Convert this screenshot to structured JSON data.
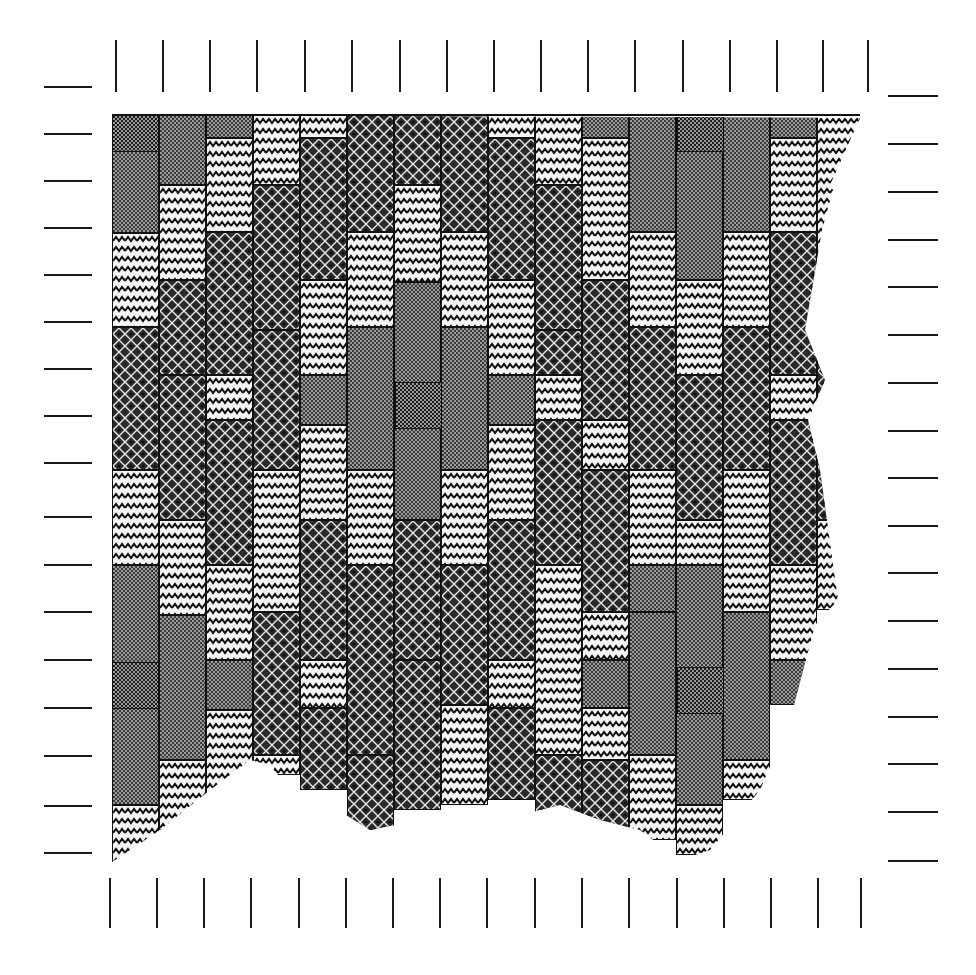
{
  "figure": {
    "kind": "woven tile / textile pattern diagram",
    "pattern_types": {
      "Z": "light zigzag (chevron) block",
      "D": "dark diamond-and-dot block",
      "C": "dark checker block (forms cross motifs)"
    },
    "colors": {
      "ink": "#111111",
      "paper": "#ffffff",
      "zigzag_bg": "#f4f4f4",
      "diamond_bg": "#2a2a2a",
      "checker_bg": "#3b3b3b"
    }
  },
  "frame": {
    "top_border": {
      "x1": 112,
      "x2": 860,
      "y": 115
    },
    "columns_x": [
      112,
      159,
      206,
      253,
      300,
      347,
      394,
      441,
      488,
      535,
      582,
      629,
      676,
      723,
      770,
      817,
      860
    ]
  },
  "ticks": {
    "top": {
      "y1": 40,
      "y2": 92,
      "x": [
        116,
        163,
        210,
        257,
        305,
        352,
        400,
        447,
        494,
        541,
        588,
        635,
        683,
        730,
        777,
        823,
        868
      ]
    },
    "bottom": {
      "y1": 878,
      "y2": 928,
      "x": [
        110,
        157,
        204,
        251,
        299,
        346,
        393,
        440,
        487,
        535,
        582,
        629,
        677,
        724,
        771,
        818,
        861
      ]
    },
    "left": {
      "x1": 44,
      "x2": 92,
      "y": [
        87,
        134,
        181,
        228,
        275,
        322,
        369,
        416,
        463,
        517,
        565,
        612,
        660,
        708,
        756,
        806,
        853
      ]
    },
    "right": {
      "x1": 888,
      "x2": 938,
      "y": [
        96,
        144,
        192,
        240,
        287,
        335,
        383,
        431,
        478,
        526,
        573,
        621,
        669,
        717,
        764,
        812,
        861
      ]
    }
  },
  "columns": [
    {
      "blocks": [
        [
          "C",
          115,
          233
        ],
        [
          "Z",
          233,
          327
        ],
        [
          "D",
          327,
          470
        ],
        [
          "Z",
          470,
          565
        ],
        [
          "C",
          565,
          805
        ],
        [
          "Z",
          805,
          865
        ]
      ]
    },
    {
      "blocks": [
        [
          "C",
          115,
          185
        ],
        [
          "Z",
          185,
          280
        ],
        [
          "D",
          280,
          375
        ],
        [
          "D",
          375,
          520
        ],
        [
          "Z",
          520,
          615
        ],
        [
          "C",
          615,
          760
        ],
        [
          "Z",
          760,
          830
        ]
      ]
    },
    {
      "blocks": [
        [
          "C",
          115,
          138
        ],
        [
          "Z",
          138,
          232
        ],
        [
          "D",
          232,
          375
        ],
        [
          "Z",
          375,
          420
        ],
        [
          "D",
          420,
          565
        ],
        [
          "Z",
          565,
          660
        ],
        [
          "C",
          660,
          710
        ],
        [
          "Z",
          710,
          800
        ]
      ]
    },
    {
      "blocks": [
        [
          "Z",
          115,
          185
        ],
        [
          "D",
          185,
          330
        ],
        [
          "D",
          330,
          470
        ],
        [
          "Z",
          470,
          612
        ],
        [
          "D",
          612,
          755
        ],
        [
          "Z",
          755,
          775
        ]
      ]
    },
    {
      "blocks": [
        [
          "Z",
          115,
          138
        ],
        [
          "D",
          138,
          280
        ],
        [
          "Z",
          280,
          375
        ],
        [
          "C",
          375,
          425
        ],
        [
          "Z",
          425,
          520
        ],
        [
          "D",
          520,
          660
        ],
        [
          "Z",
          660,
          708
        ],
        [
          "D",
          708,
          790
        ]
      ]
    },
    {
      "blocks": [
        [
          "D",
          115,
          232
        ],
        [
          "Z",
          232,
          327
        ],
        [
          "C",
          327,
          470
        ],
        [
          "Z",
          470,
          565
        ],
        [
          "D",
          565,
          755
        ],
        [
          "D",
          755,
          830
        ]
      ]
    },
    {
      "blocks": [
        [
          "D",
          115,
          185
        ],
        [
          "Z",
          185,
          282
        ],
        [
          "C",
          282,
          520
        ],
        [
          "D",
          520,
          660
        ],
        [
          "D",
          660,
          810
        ]
      ]
    },
    {
      "blocks": [
        [
          "D",
          115,
          232
        ],
        [
          "Z",
          232,
          327
        ],
        [
          "C",
          327,
          470
        ],
        [
          "Z",
          470,
          565
        ],
        [
          "D",
          565,
          705
        ],
        [
          "Z",
          705,
          805
        ]
      ]
    },
    {
      "blocks": [
        [
          "Z",
          115,
          138
        ],
        [
          "D",
          138,
          280
        ],
        [
          "Z",
          280,
          375
        ],
        [
          "C",
          375,
          425
        ],
        [
          "Z",
          425,
          520
        ],
        [
          "D",
          520,
          660
        ],
        [
          "Z",
          660,
          708
        ],
        [
          "D",
          708,
          800
        ]
      ]
    },
    {
      "blocks": [
        [
          "Z",
          115,
          185
        ],
        [
          "D",
          185,
          330
        ],
        [
          "D",
          330,
          375
        ],
        [
          "Z",
          375,
          420
        ],
        [
          "D",
          420,
          565
        ],
        [
          "Z",
          565,
          755
        ],
        [
          "D",
          755,
          815
        ]
      ]
    },
    {
      "blocks": [
        [
          "C",
          115,
          138
        ],
        [
          "Z",
          138,
          280
        ],
        [
          "D",
          280,
          420
        ],
        [
          "Z",
          420,
          470
        ],
        [
          "D",
          470,
          612
        ],
        [
          "Z",
          612,
          660
        ],
        [
          "C",
          660,
          708
        ],
        [
          "Z",
          708,
          760
        ],
        [
          "D",
          760,
          830
        ]
      ]
    },
    {
      "blocks": [
        [
          "C",
          115,
          232
        ],
        [
          "Z",
          232,
          327
        ],
        [
          "D",
          327,
          470
        ],
        [
          "Z",
          470,
          565
        ],
        [
          "C",
          565,
          612
        ],
        [
          "C",
          612,
          755
        ],
        [
          "Z",
          755,
          840
        ]
      ]
    },
    {
      "blocks": [
        [
          "C",
          115,
          280
        ],
        [
          "Z",
          280,
          375
        ],
        [
          "D",
          375,
          520
        ],
        [
          "Z",
          520,
          565
        ],
        [
          "C",
          565,
          805
        ],
        [
          "Z",
          805,
          855
        ]
      ]
    },
    {
      "blocks": [
        [
          "C",
          115,
          232
        ],
        [
          "Z",
          232,
          327
        ],
        [
          "D",
          327,
          470
        ],
        [
          "Z",
          470,
          612
        ],
        [
          "C",
          612,
          760
        ],
        [
          "Z",
          760,
          800
        ]
      ]
    },
    {
      "blocks": [
        [
          "C",
          115,
          138
        ],
        [
          "Z",
          138,
          232
        ],
        [
          "D",
          232,
          375
        ],
        [
          "Z",
          375,
          420
        ],
        [
          "D",
          420,
          565
        ],
        [
          "Z",
          565,
          660
        ],
        [
          "C",
          660,
          705
        ]
      ]
    },
    {
      "blocks": [
        [
          "Z",
          115,
          280
        ],
        [
          "D",
          280,
          520
        ],
        [
          "Z",
          520,
          610
        ]
      ]
    }
  ],
  "cross_centers": [
    {
      "label": "top-left",
      "x": 135,
      "y": 128
    },
    {
      "label": "top-right",
      "x": 700,
      "y": 128
    },
    {
      "label": "center",
      "x": 418,
      "y": 405
    },
    {
      "label": "bottom-left",
      "x": 135,
      "y": 685
    },
    {
      "label": "bottom-right",
      "x": 700,
      "y": 690
    }
  ],
  "outline": {
    "clip_polygon": [
      [
        112,
        115
      ],
      [
        860,
        118
      ],
      [
        830,
        185
      ],
      [
        833,
        190
      ],
      [
        822,
        230
      ],
      [
        805,
        330
      ],
      [
        825,
        380
      ],
      [
        808,
        420
      ],
      [
        820,
        470
      ],
      [
        838,
        600
      ],
      [
        815,
        625
      ],
      [
        790,
        720
      ],
      [
        760,
        790
      ],
      [
        710,
        850
      ],
      [
        680,
        860
      ],
      [
        640,
        830
      ],
      [
        600,
        820
      ],
      [
        560,
        805
      ],
      [
        520,
        815
      ],
      [
        470,
        840
      ],
      [
        420,
        820
      ],
      [
        370,
        830
      ],
      [
        330,
        805
      ],
      [
        290,
        790
      ],
      [
        270,
        765
      ],
      [
        250,
        760
      ],
      [
        210,
        790
      ],
      [
        160,
        830
      ],
      [
        112,
        862
      ]
    ]
  }
}
